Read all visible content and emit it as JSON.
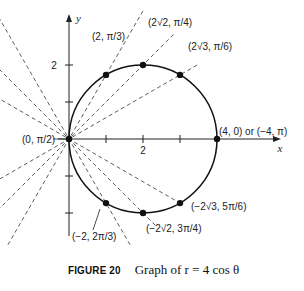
{
  "chart_data": {
    "type": "scatter",
    "title": "Graph of r = 4 cos θ",
    "figure_label": "FIGURE 20",
    "xlabel": "x",
    "ylabel": "y",
    "x_ticks": [
      1,
      2,
      3
    ],
    "x_tick_labels_shown": [
      "2"
    ],
    "y_ticks": [
      -2,
      -1,
      1,
      2
    ],
    "y_tick_labels_shown": [
      "2"
    ],
    "xlim": [
      -1.9,
      5.0
    ],
    "ylim": [
      -3.0,
      3.4
    ],
    "grid": false,
    "curve": {
      "equation": "r = 4 cos θ",
      "shape": "circle",
      "center": [
        2,
        0
      ],
      "radius": 2
    },
    "points": [
      {
        "label": "(0, π/2)",
        "x": 0,
        "y": 0
      },
      {
        "label": "(2, π/3)",
        "x": 1,
        "y": 1.732
      },
      {
        "label": "(2√2, π/4)",
        "x": 2,
        "y": 2
      },
      {
        "label": "(2√3, π/6)",
        "x": 3,
        "y": 1.732
      },
      {
        "label": "(4, 0) or (−4, π)",
        "x": 4,
        "y": 0
      },
      {
        "label": "(−2√3, 5π/6)",
        "x": 3,
        "y": -1.732
      },
      {
        "label": "(−2√2, 3π/4)",
        "x": 2,
        "y": -2
      },
      {
        "label": "(−2, 2π/3)",
        "x": 1,
        "y": -1.732
      }
    ],
    "dashed_rays_through_origin_degrees": [
      30,
      45,
      60,
      120,
      135,
      150
    ]
  },
  "caption": {
    "figure_label": "FIGURE 20",
    "text": "Graph of r = 4 cos θ"
  },
  "labels": {
    "x_axis": "x",
    "y_axis": "y",
    "y_tick_2": "2",
    "x_tick_2": "2"
  }
}
